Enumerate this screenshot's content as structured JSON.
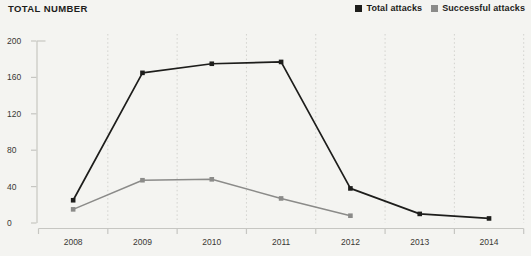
{
  "header": {
    "title": "TOTAL NUMBER"
  },
  "legend": {
    "items": [
      {
        "label": "Total attacks",
        "color": "#1d1d1b"
      },
      {
        "label": "Successful attacks",
        "color": "#8b8b89"
      }
    ]
  },
  "chart_data": {
    "type": "line",
    "title": "TOTAL NUMBER",
    "ylabel": "TOTAL NUMBER",
    "x": [
      "2008",
      "2009",
      "2010",
      "2011",
      "2012",
      "2013",
      "2014"
    ],
    "series": [
      {
        "name": "Total attacks",
        "color": "#1d1d1b",
        "values": [
          25,
          165,
          175,
          177,
          38,
          10,
          5
        ]
      },
      {
        "name": "Successful attacks",
        "color": "#8b8b89",
        "values": [
          15,
          47,
          48,
          27,
          8,
          null,
          null
        ]
      }
    ],
    "ylim": [
      0,
      200
    ],
    "yticks": [
      0,
      40,
      80,
      120,
      160,
      200
    ],
    "grid": "vertical-dashed",
    "legend_position": "top-right"
  },
  "colors": {
    "background": "#f4f4f1",
    "axis": "#c6c6c2",
    "grid": "#d2d2ce",
    "tick_text": "#3a3834"
  }
}
